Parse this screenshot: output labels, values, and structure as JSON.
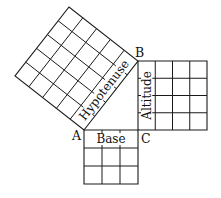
{
  "vertices": {
    "a": "A",
    "b": "B",
    "c": "C"
  },
  "sides": {
    "base": {
      "label": "Base",
      "units": 3
    },
    "altitude": {
      "label": "Altitude",
      "units": 4
    },
    "hypotenuse": {
      "label": "Hypotenuse",
      "units": 5
    }
  },
  "colors": {
    "line": "#1a1a1a",
    "background": "#ffffff",
    "text": "#111111"
  }
}
